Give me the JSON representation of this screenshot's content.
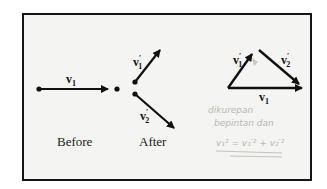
{
  "diagram": {
    "labels": {
      "before": "Before",
      "after": "After"
    },
    "vectors": {
      "v1": {
        "main": "v",
        "sub": "1",
        "prime": ""
      },
      "v1_prime": {
        "main": "v",
        "sub": "1",
        "prime": "′"
      },
      "v2_prime": {
        "main": "v",
        "sub": "2",
        "prime": "′"
      }
    },
    "handwritten_notes": {
      "line1": "dikurepan",
      "line2": "bepintan dan",
      "line3": "v₁² = v₁′² + v₂′²"
    },
    "colors": {
      "frame_border": "#151515",
      "background": "#f4f4f2",
      "ink": "#111111",
      "pencil": "#b8b8b0"
    }
  }
}
